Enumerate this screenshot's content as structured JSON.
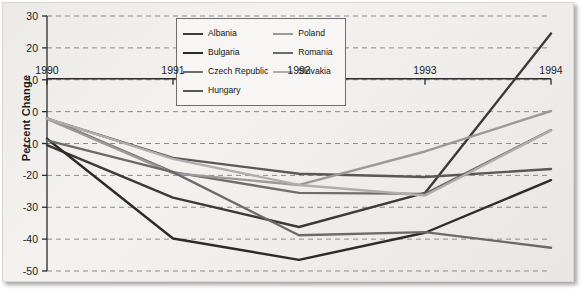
{
  "figure": {
    "ylabel": "Percent Change"
  },
  "chart_data": {
    "type": "line",
    "title": "",
    "xlabel": "",
    "ylabel": "Percent Change",
    "x": [
      1990,
      1991,
      1992,
      1993,
      1994
    ],
    "xtick_labels": [
      "1990",
      "1991",
      "1992",
      "1993",
      "1994"
    ],
    "ytick_labels": [
      "30",
      "20",
      "10",
      "0",
      "-10",
      "-20",
      "-30",
      "-40",
      "-50"
    ],
    "yticks": [
      30,
      20,
      10,
      0,
      -10,
      -20,
      -30,
      -40,
      -50
    ],
    "ylim": [
      -50,
      30
    ],
    "xlim": [
      1990,
      1994
    ],
    "grid": "horizontal-dashed",
    "legend_position": "top-center-inside",
    "series": [
      {
        "name": "Albania",
        "color": "#3a3a3a",
        "width": 2.4,
        "values": [
          -10.5,
          -27.0,
          -36.2,
          -25.5,
          24.5
        ]
      },
      {
        "name": "Bulgaria",
        "color": "#2b2b2b",
        "width": 2.4,
        "values": [
          -8.5,
          -39.8,
          -46.5,
          -38.0,
          -21.5
        ]
      },
      {
        "name": "Czech Republic",
        "color": "#6e6e6e",
        "width": 2.4,
        "values": [
          -2.0,
          -19.0,
          -25.5,
          -25.8,
          -5.8
        ]
      },
      {
        "name": "Hungary",
        "color": "#585858",
        "width": 2.4,
        "values": [
          -2.2,
          -14.5,
          -19.5,
          -20.5,
          -18.0
        ]
      },
      {
        "name": "Poland",
        "color": "#9a9a9a",
        "width": 2.4,
        "values": [
          -2.3,
          -19.3,
          -23.0,
          -12.5,
          0.2
        ]
      },
      {
        "name": "Romania",
        "color": "#6a6a6a",
        "width": 2.4,
        "values": [
          -9.0,
          -19.0,
          -38.8,
          -37.8,
          -42.7
        ]
      },
      {
        "name": "Slovakia",
        "color": "#aeaeae",
        "width": 2.4,
        "values": [
          -2.1,
          -14.8,
          -23.0,
          -26.3,
          -5.9
        ]
      }
    ],
    "legend_entries": [
      {
        "label": "Albania",
        "color": "#3a3a3a",
        "column": 0
      },
      {
        "label": "Bulgaria",
        "color": "#2b2b2b",
        "column": 0
      },
      {
        "label": "Czech Republic",
        "color": "#6e6e6e",
        "column": 0
      },
      {
        "label": "Hungary",
        "color": "#585858",
        "column": 0
      },
      {
        "label": "Poland",
        "color": "#9a9a9a",
        "column": 1
      },
      {
        "label": "Romania",
        "color": "#6a6a6a",
        "column": 1
      },
      {
        "label": "Slovakia",
        "color": "#aeaeae",
        "column": 1
      }
    ]
  }
}
